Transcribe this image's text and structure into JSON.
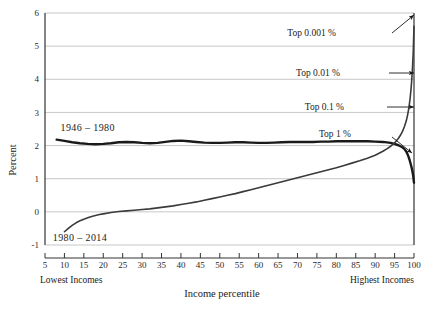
{
  "chart_data": {
    "type": "line",
    "title": "",
    "xlabel": "Income percentile",
    "ylabel": "Percent",
    "xlim": [
      5,
      100
    ],
    "ylim": [
      -1,
      6
    ],
    "grid": true,
    "legend_position": "inline-annotation",
    "xticks": [
      5,
      10,
      15,
      20,
      25,
      30,
      35,
      40,
      45,
      50,
      55,
      60,
      65,
      70,
      75,
      80,
      85,
      90,
      95,
      100
    ],
    "xtick_labels": [
      "5",
      "10",
      "15",
      "20",
      "25",
      "30",
      "35",
      "40",
      "45",
      "50",
      "55",
      "60",
      "65",
      "70",
      "75",
      "80",
      "85",
      "90",
      "95",
      "100"
    ],
    "yticks": [
      -1,
      0,
      1,
      2,
      3,
      4,
      5,
      6
    ],
    "ytick_labels": [
      "-1",
      "0",
      "1",
      "2",
      "3",
      "4",
      "5",
      "6"
    ],
    "x_axis_end_labels": {
      "left": "Lowest Incomes",
      "right": "Highest Incomes"
    },
    "series": [
      {
        "name": "1946 – 1980",
        "label": "1946 – 1980",
        "color": "#1a1a1a",
        "width": 2.4,
        "label_x": 16,
        "label_y": 2.45,
        "x": [
          8,
          10,
          12,
          14,
          16,
          18,
          20,
          22,
          24,
          26,
          28,
          30,
          32,
          34,
          36,
          38,
          40,
          42,
          44,
          46,
          48,
          50,
          52,
          54,
          56,
          58,
          60,
          62,
          64,
          66,
          68,
          70,
          72,
          74,
          76,
          78,
          80,
          82,
          84,
          86,
          88,
          90,
          92,
          94,
          95,
          96,
          97,
          97.5,
          98,
          98.3,
          98.6,
          98.9,
          99.2,
          99.4,
          99.6,
          99.8,
          99.9,
          99.95,
          100
        ],
        "y": [
          2.18,
          2.14,
          2.1,
          2.07,
          2.05,
          2.04,
          2.05,
          2.07,
          2.1,
          2.11,
          2.1,
          2.08,
          2.07,
          2.08,
          2.11,
          2.14,
          2.15,
          2.13,
          2.11,
          2.09,
          2.08,
          2.08,
          2.09,
          2.1,
          2.1,
          2.09,
          2.08,
          2.08,
          2.09,
          2.1,
          2.11,
          2.11,
          2.11,
          2.11,
          2.12,
          2.12,
          2.13,
          2.13,
          2.13,
          2.13,
          2.13,
          2.12,
          2.11,
          2.08,
          2.05,
          2.01,
          1.95,
          1.9,
          1.82,
          1.75,
          1.66,
          1.55,
          1.42,
          1.33,
          1.22,
          1.08,
          0.98,
          0.92,
          0.88
        ]
      },
      {
        "name": "1980 – 2014",
        "label": "1980 – 2014",
        "color": "#3a3a3a",
        "width": 1.6,
        "label_x": 14,
        "label_y": -0.88,
        "x": [
          10,
          11,
          12,
          13,
          14,
          15,
          16,
          17,
          18,
          19,
          20,
          22,
          24,
          26,
          28,
          30,
          32,
          34,
          36,
          38,
          40,
          42,
          44,
          46,
          48,
          50,
          52,
          54,
          56,
          58,
          60,
          62,
          64,
          66,
          68,
          70,
          72,
          74,
          76,
          78,
          80,
          82,
          84,
          86,
          88,
          90,
          92,
          93,
          94,
          95,
          96,
          96.5,
          97,
          97.5,
          98,
          98.4,
          98.7,
          99,
          99.2,
          99.4,
          99.6,
          99.8,
          99.9,
          100
        ],
        "y": [
          -0.6,
          -0.5,
          -0.41,
          -0.33,
          -0.27,
          -0.22,
          -0.18,
          -0.14,
          -0.11,
          -0.08,
          -0.06,
          -0.02,
          0.01,
          0.03,
          0.05,
          0.07,
          0.09,
          0.12,
          0.15,
          0.18,
          0.22,
          0.26,
          0.3,
          0.35,
          0.4,
          0.45,
          0.5,
          0.55,
          0.61,
          0.67,
          0.73,
          0.79,
          0.85,
          0.91,
          0.97,
          1.03,
          1.09,
          1.15,
          1.21,
          1.27,
          1.33,
          1.4,
          1.47,
          1.54,
          1.62,
          1.71,
          1.83,
          1.9,
          1.98,
          2.08,
          2.22,
          2.31,
          2.42,
          2.56,
          2.74,
          2.95,
          3.15,
          3.42,
          3.66,
          3.95,
          4.32,
          4.8,
          5.2,
          5.6
        ]
      }
    ],
    "annotations": [
      {
        "text": "Top 0.001 %",
        "text_x": 336,
        "text_y": 36,
        "arrow": "up-right",
        "ax1": 392,
        "ay1": 33,
        "ax2": 414,
        "ay2": 15
      },
      {
        "text": "Top 0.01 %",
        "text_x": 340,
        "text_y": 76,
        "arrow": "right",
        "ax1": 389,
        "ay1": 73,
        "ax2": 414,
        "ay2": 73
      },
      {
        "text": "Top 0.1 %",
        "text_x": 344,
        "text_y": 110,
        "arrow": "right",
        "ax1": 387,
        "ay1": 107,
        "ax2": 414,
        "ay2": 107
      },
      {
        "text": "Top 1 %",
        "text_x": 351,
        "text_y": 137,
        "arrow": "down-right",
        "ax1": 392,
        "ay1": 137,
        "ax2": 412,
        "ay2": 153
      }
    ],
    "colors": {
      "background": "#ffffff",
      "gridline": "#b9b9b9",
      "axis": "#333333",
      "series_1946_1980": "#1a1a1a",
      "series_1980_2014": "#3a3a3a"
    }
  }
}
